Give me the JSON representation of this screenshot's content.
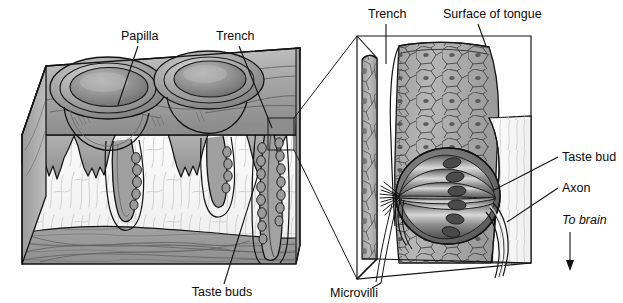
{
  "figure": {
    "background": "#ffffff",
    "ink": "#111111",
    "width": 623,
    "height": 303
  },
  "labels": {
    "papilla": "Papilla",
    "trench_left": "Trench",
    "taste_buds": "Taste buds",
    "trench_right": "Trench",
    "surface_of_tongue": "Surface of tongue",
    "taste_bud": "Taste bud",
    "axon": "Axon",
    "to_brain": "To brain",
    "microvilli": "Microvilli"
  },
  "panels": {
    "left": {
      "name": "tongue-tissue-block",
      "description": "Three-dimensional cut block of tongue tissue showing two circumvallate papillae on the upper surface and a cross section of epithelium, connective tissue and muscle below",
      "papillae_count": 2,
      "trench_count": 3,
      "layers": [
        {
          "name": "epithelium",
          "color": "#a0a0a0"
        },
        {
          "name": "connective-tissue",
          "color": "#f2f2f2"
        },
        {
          "name": "muscle",
          "color": "#9a9a9a"
        }
      ]
    },
    "right": {
      "name": "taste-bud-magnified",
      "description": "Magnified view of the trench wall showing stratified squamous epithelium and a single taste bud with taste cells, microvilli and afferent axons",
      "taste_cell_count": 6,
      "layers": [
        {
          "name": "epithelial-cells",
          "color": "#adadad"
        },
        {
          "name": "taste-bud",
          "color": "#6e6e6e"
        },
        {
          "name": "connective-tissue-channel",
          "color": "#f7f7f7"
        }
      ]
    }
  },
  "colors": {
    "epithelium_mid": "#a6a6a6",
    "epithelium_dark": "#7d7d7d",
    "epithelium_light": "#c8c8c8",
    "connective": "#f4f4f4",
    "muscle": "#9b9b9b",
    "taste_bud_body": "#707070",
    "taste_cell_nucleus": "#4a4a4a",
    "outline": "#141414"
  }
}
